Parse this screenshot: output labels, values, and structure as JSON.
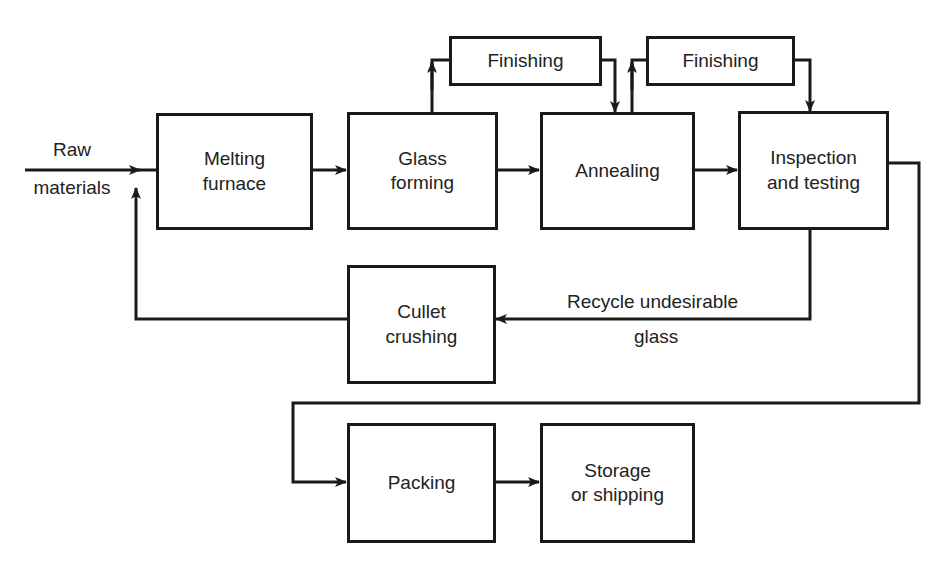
{
  "diagram": {
    "type": "process-flowchart",
    "inputs": {
      "raw_materials": "Raw\nmaterials"
    },
    "nodes": {
      "melting": "Melting\nfurnace",
      "forming": "Glass\nforming",
      "annealing": "Annealing",
      "inspection": "Inspection\nand testing",
      "finishing1": "Finishing",
      "finishing2": "Finishing",
      "cullet": "Cullet\ncrushing",
      "packing": "Packing",
      "storage": "Storage\nor shipping"
    },
    "edge_labels": {
      "recycle_line1": "Recycle undesirable",
      "recycle_line2": "glass",
      "raw_line1": "Raw",
      "raw_line2": "materials"
    },
    "edges": [
      {
        "from": "raw_materials",
        "to": "melting"
      },
      {
        "from": "melting",
        "to": "forming"
      },
      {
        "from": "forming",
        "to": "annealing"
      },
      {
        "from": "forming",
        "to": "finishing1"
      },
      {
        "from": "finishing1",
        "to": "annealing"
      },
      {
        "from": "annealing",
        "to": "inspection"
      },
      {
        "from": "annealing",
        "to": "finishing2"
      },
      {
        "from": "finishing2",
        "to": "inspection"
      },
      {
        "from": "inspection",
        "to": "cullet",
        "label": "Recycle undesirable glass"
      },
      {
        "from": "cullet",
        "to": "melting"
      },
      {
        "from": "inspection",
        "to": "packing"
      },
      {
        "from": "packing",
        "to": "storage"
      }
    ],
    "colors": {
      "line": "#1a1a1a",
      "text": "#222222",
      "background": "#ffffff"
    }
  }
}
